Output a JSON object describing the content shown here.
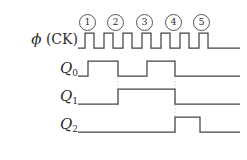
{
  "figure": {
    "type": "timing-diagram",
    "title": "",
    "background": "#ffffff",
    "line_color": "#444444",
    "guide_color": "#bdbdbd",
    "text_color": "#2b2b2b"
  },
  "clock_markers": [
    {
      "label": "①",
      "number": 1,
      "x": 86
    },
    {
      "label": "②",
      "number": 2,
      "x": 114
    },
    {
      "label": "③",
      "number": 3,
      "x": 143
    },
    {
      "label": "④",
      "number": 4,
      "x": 172
    },
    {
      "label": "⑤",
      "number": 5,
      "x": 200
    }
  ],
  "signals": [
    {
      "name": "phi",
      "label_main": "ϕ",
      "label_paren": "(CK)",
      "subscript": "",
      "row_baseline_y": 48,
      "row_high_y": 33
    },
    {
      "name": "Q0",
      "label_main": "Q",
      "subscript": "0",
      "row_baseline_y": 76,
      "row_high_y": 61
    },
    {
      "name": "Q1",
      "label_main": "Q",
      "subscript": "1",
      "row_baseline_y": 104,
      "row_high_y": 89
    },
    {
      "name": "Q2",
      "label_main": "Q",
      "subscript": "2",
      "row_baseline_y": 132,
      "row_high_y": 117
    }
  ],
  "waveform_paths": {
    "clock": "M78,48 L85,48 L85,33 L94,33 L94,48 L104,48 L104,33 L113,33 L113,48 L123,48 L123,33 L132,33 L132,48 L142,48 L142,33 L151,33 L151,48 L161,48 L161,33 L170,33 L170,48 L180,48 L180,33 L189,33 L189,48 L199,48 L199,33 L208,33 L208,48 L240,48",
    "q0": "M78,76 L88,76 L88,61 L118,61 L118,76 L147,76 L147,61 L175,61 L175,76 L240,76",
    "q1": "M78,104 L118,104 L118,89 L175,89 L175,104 L240,104",
    "q2": "M78,132 L175,132 L175,117 L200,117 L200,132 L240,132"
  },
  "guide_lines": [
    {
      "x": 118,
      "y1": 64,
      "y2": 106
    },
    {
      "x": 175,
      "y1": 64,
      "y2": 134
    }
  ]
}
